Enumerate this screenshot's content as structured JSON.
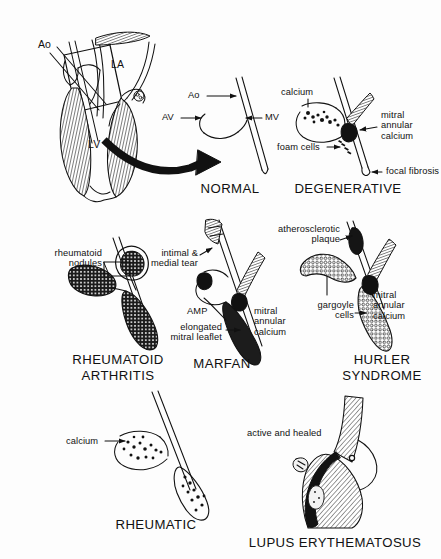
{
  "figure": {
    "title_visible": false,
    "background_color": "#fdfdfd",
    "ink_color": "#111111",
    "style": "black-and-white line drawing, medical illustration"
  },
  "heart_overview": {
    "labels": {
      "aorta": "Ao",
      "left_atrium": "LA",
      "left_ventricle": "LV"
    }
  },
  "panels": [
    {
      "id": "normal",
      "caption": "NORMAL",
      "annotations": [
        {
          "id": "ao",
          "text": "Ao"
        },
        {
          "id": "av",
          "text": "AV"
        },
        {
          "id": "mv",
          "text": "MV"
        }
      ]
    },
    {
      "id": "degenerative",
      "caption": "DEGENERATIVE",
      "annotations": [
        {
          "id": "calcium",
          "text": "calcium"
        },
        {
          "id": "mitral-annular-calcium",
          "text": "mitral\nannular\ncalcium"
        },
        {
          "id": "foam-cells",
          "text": "foam cells"
        },
        {
          "id": "focal-fibrosis",
          "text": "focal fibrosis"
        }
      ]
    },
    {
      "id": "rheumatoid-arthritis",
      "caption": "RHEUMATOID\nARTHRITIS",
      "annotations": [
        {
          "id": "rheumatoid-nodules",
          "text": "rheumatoid\nnodules"
        }
      ]
    },
    {
      "id": "marfan",
      "caption": "MARFAN",
      "annotations": [
        {
          "id": "intimal-medial-tear",
          "text": "intimal &\nmedial tear"
        },
        {
          "id": "amp",
          "text": "AMP"
        },
        {
          "id": "elongated-mitral-leaflet",
          "text": "elongated\nmitral leaflet"
        },
        {
          "id": "mitral-annular-calcium",
          "text": "mitral\nannular\ncalcium"
        }
      ]
    },
    {
      "id": "hurler-syndrome",
      "caption": "HURLER\nSYNDROME",
      "annotations": [
        {
          "id": "atherosclerotic-plaque",
          "text": "atherosclerotic\nplaque"
        },
        {
          "id": "gargoyle-cells",
          "text": "gargoyle\ncells"
        },
        {
          "id": "mitral-annular-calcium",
          "text": "mitral\nannular\ncalcium"
        }
      ]
    },
    {
      "id": "rheumatic",
      "caption": "RHEUMATIC",
      "annotations": [
        {
          "id": "calcium",
          "text": "calcium"
        }
      ]
    },
    {
      "id": "lupus-erythematosus",
      "caption": "LUPUS ERYTHEMATOSUS",
      "annotations": [
        {
          "id": "active-and-healed",
          "text": "active and healed"
        }
      ]
    }
  ]
}
